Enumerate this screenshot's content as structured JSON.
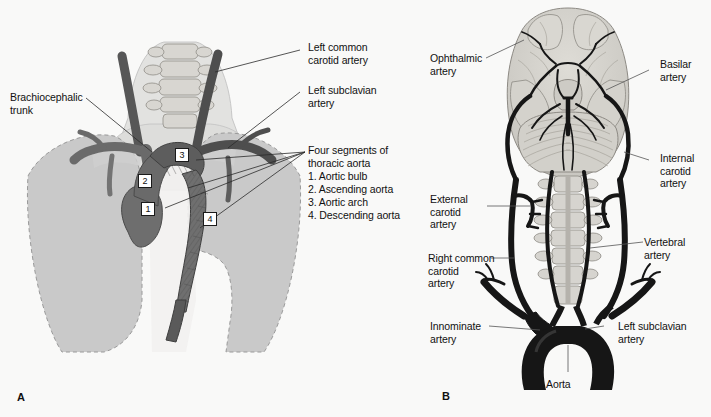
{
  "figure": {
    "type": "anatomical-illustration",
    "style": "grayscale halftone medical drawing",
    "panels": [
      {
        "id": "A",
        "letter": "A",
        "title": "Thoracic aorta within the chest"
      },
      {
        "id": "B",
        "letter": "B",
        "title": "Arterial supply to the brain and neck"
      }
    ]
  },
  "panelA": {
    "letter": "A",
    "labels": {
      "brachiocephalic_trunk": "Brachiocephalic\ntrunk",
      "left_common_carotid": "Left common\ncarotid artery",
      "left_subclavian": "Left subclavian\nartery",
      "four_segments_heading": "Four segments of\nthoracic aorta",
      "segment_1": "1. Aortic bulb",
      "segment_2": "2. Ascending aorta",
      "segment_3": "3. Aortic arch",
      "segment_4": "4. Descending aorta"
    },
    "markers": [
      {
        "number": "1",
        "name": "Aortic bulb"
      },
      {
        "number": "2",
        "name": "Ascending aorta"
      },
      {
        "number": "3",
        "name": "Aortic arch"
      },
      {
        "number": "4",
        "name": "Descending aorta"
      }
    ]
  },
  "panelB": {
    "letter": "B",
    "labels": {
      "ophthalmic": "Ophthalmic\nartery",
      "basilar": "Basilar\nartery",
      "internal_carotid": "Internal\ncarotid\nartery",
      "external_carotid": "External\ncarotid\nartery",
      "vertebral": "Vertebral\nartery",
      "right_common_carotid": "Right common\ncarotid\nartery",
      "innominate": "Innominate\nartery",
      "left_subclavian": "Left subclavian\nartery",
      "aorta": "Aorta"
    }
  },
  "colors": {
    "background": "#f9f9f8",
    "lung_fill": "#c9c9c9",
    "soft_tissue": "#dedede",
    "bone_fill": "#d6d4cf",
    "vessel_mid": "#6f6f6f",
    "vessel_dark": "#4a4a4a",
    "vessel_black": "#1c1c1c",
    "brain_fill": "#d2d2cd",
    "text": "#111111",
    "leader_line": "#2b2b2b"
  }
}
